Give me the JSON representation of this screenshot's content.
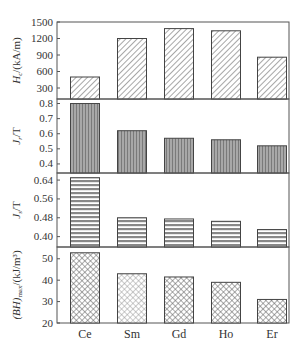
{
  "chart_data": [
    {
      "type": "bar",
      "panel": 1,
      "categories": [
        "Ce",
        "Sm",
        "Gd",
        "Ho",
        "Er"
      ],
      "values": [
        500,
        1200,
        1380,
        1340,
        860
      ],
      "ylabel": "Hc/(kA/m)",
      "ylabel_main": "H",
      "ylabel_sub": "c",
      "ylabel_rest": "/(kA/m)",
      "yticks": [
        300,
        600,
        900,
        1200,
        1500
      ],
      "ylim": [
        100,
        1500
      ],
      "pattern": "diagonal-hatch"
    },
    {
      "type": "bar",
      "panel": 2,
      "categories": [
        "Ce",
        "Sm",
        "Gd",
        "Ho",
        "Er"
      ],
      "values": [
        0.8,
        0.62,
        0.57,
        0.56,
        0.52
      ],
      "ylabel": "Jr/T",
      "ylabel_main": "J",
      "ylabel_sub": "r",
      "ylabel_rest": "/T",
      "yticks": [
        0.4,
        0.5,
        0.6,
        0.7,
        0.8
      ],
      "ylim": [
        0.34,
        0.83
      ],
      "pattern": "vertical-lines"
    },
    {
      "type": "bar",
      "panel": 3,
      "categories": [
        "Ce",
        "Sm",
        "Gd",
        "Ho",
        "Er"
      ],
      "values": [
        0.65,
        0.48,
        0.475,
        0.465,
        0.43
      ],
      "ylabel": "Js/T",
      "ylabel_main": "J",
      "ylabel_sub": "s",
      "ylabel_rest": "/T",
      "yticks": [
        0.4,
        0.48,
        0.56,
        0.64
      ],
      "ylim": [
        0.356,
        0.67
      ],
      "pattern": "horizontal-lines"
    },
    {
      "type": "bar",
      "panel": 4,
      "categories": [
        "Ce",
        "Sm",
        "Gd",
        "Ho",
        "Er"
      ],
      "values": [
        52.8,
        43,
        41.5,
        39,
        31
      ],
      "ylabel": "(BH)max/(kJ/m³)",
      "ylabel_main": "(BH)",
      "ylabel_sub": "max",
      "ylabel_rest": "/(kJ/m³)",
      "yticks": [
        20,
        30,
        40,
        50
      ],
      "ylim": [
        20,
        55.5
      ],
      "pattern": "cross-hatch"
    }
  ],
  "xlabel": "",
  "x_categories": [
    "Ce",
    "Sm",
    "Gd",
    "Ho",
    "Er"
  ],
  "colors": {
    "axis": "#555555",
    "bar_stroke": "#444444",
    "hatch": "#777777",
    "vertical_fill": "#9a9a9a",
    "horizontal_fill": "#8c8c8c"
  }
}
